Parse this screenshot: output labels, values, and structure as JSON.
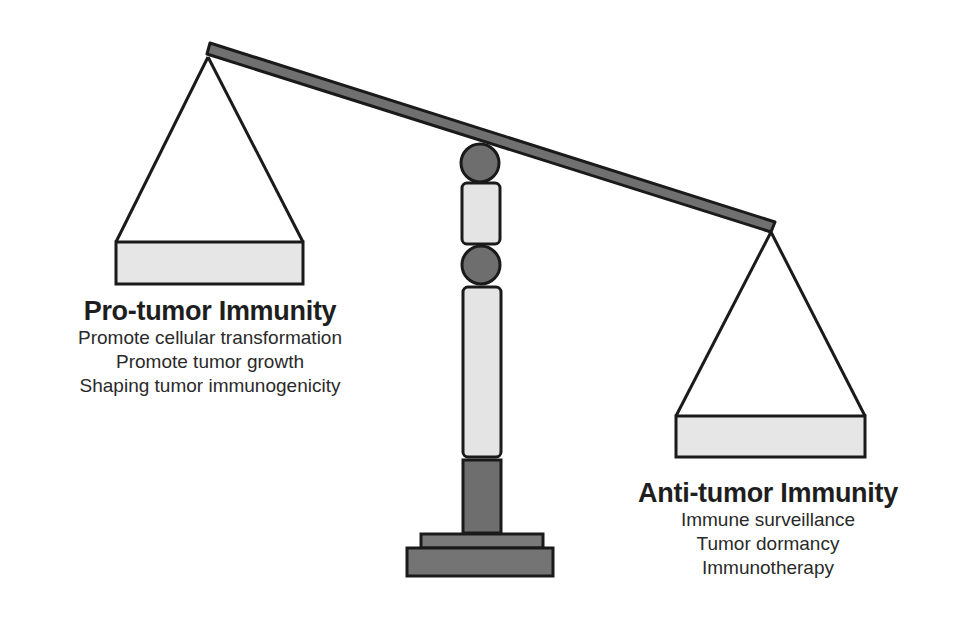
{
  "diagram": {
    "type": "balance-scale",
    "tilt": "left-side-up",
    "colors": {
      "outline": "#1a1a1a",
      "beam": "#707070",
      "pan": "#e6e6e6",
      "column_light": "#e4e4e4",
      "column_dark": "#6e6e6e",
      "base": "#747474"
    }
  },
  "left_pan": {
    "title": "Pro-tumor Immunity",
    "lines": [
      "Promote cellular transformation",
      "Promote tumor growth",
      "Shaping tumor immunogenicity"
    ]
  },
  "right_pan": {
    "title": "Anti-tumor Immunity",
    "lines": [
      "Immune surveillance",
      "Tumor dormancy",
      "Immunotherapy"
    ]
  }
}
